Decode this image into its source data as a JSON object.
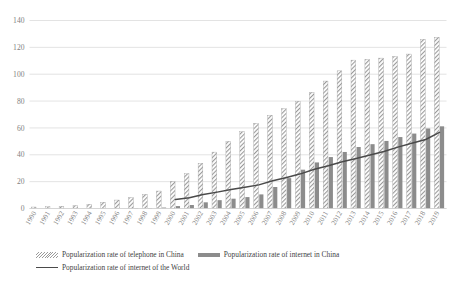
{
  "chart_data": {
    "type": "bar",
    "title": "",
    "subtitle": "",
    "xlabel": "",
    "ylabel": "",
    "ylim": [
      0,
      140
    ],
    "yticks": [
      0,
      20,
      40,
      60,
      80,
      100,
      120,
      140
    ],
    "ytick_labels": [
      "0",
      "20",
      "40",
      "60",
      "80",
      "100",
      "120",
      "140"
    ],
    "grid": true,
    "legend_position": "bottom",
    "categories": [
      "1990",
      "1991",
      "1992",
      "1993",
      "1994",
      "1995",
      "1996",
      "1997",
      "1998",
      "1999",
      "2000",
      "2001",
      "2002",
      "2003",
      "2004",
      "2005",
      "2006",
      "2007",
      "2008",
      "2009",
      "2010",
      "2011",
      "2012",
      "2013",
      "2014",
      "2015",
      "2016",
      "2017",
      "2018",
      "2019"
    ],
    "series": [
      {
        "name": "Popularization rate of telephone in China",
        "style": "bar-hatched",
        "color": "#9a9a9a",
        "values": [
          1.1,
          1.3,
          1.6,
          2.2,
          3.2,
          4.7,
          6.3,
          8.1,
          10.5,
          13.0,
          20.1,
          25.9,
          33.7,
          42.0,
          50.0,
          57.2,
          63.4,
          69.5,
          74.3,
          79.9,
          86.5,
          94.9,
          102.5,
          110.5,
          111.0,
          112.0,
          113.2,
          115.0,
          126.0,
          127.5
        ]
      },
      {
        "name": "Popularization rate of internet in China",
        "style": "bar-solid",
        "color": "#8c8c8c",
        "values": [
          0,
          0,
          0,
          0,
          0,
          0,
          0,
          0.1,
          0.2,
          0.7,
          1.8,
          2.6,
          4.6,
          6.2,
          7.3,
          8.5,
          10.5,
          16.0,
          22.6,
          28.9,
          34.3,
          38.3,
          42.1,
          45.8,
          47.9,
          50.3,
          53.2,
          55.8,
          59.6,
          61.2
        ]
      },
      {
        "name": "Popularization rate of internet of the World",
        "style": "line",
        "color": "#4a4a4a",
        "start_year": "2000",
        "values": [
          null,
          null,
          null,
          null,
          null,
          null,
          null,
          null,
          null,
          null,
          6.7,
          8.0,
          10.5,
          12.2,
          14.1,
          15.8,
          17.6,
          20.6,
          23.1,
          25.8,
          29.2,
          31.8,
          34.8,
          37.3,
          39.9,
          42.4,
          45.7,
          48.6,
          51.4,
          56.7
        ]
      }
    ],
    "legend": [
      {
        "label": "Popularization rate of telephone in China",
        "marker": "hatched-bar-swatch"
      },
      {
        "label": "Popularization rate of internet in China",
        "marker": "solid-bar-swatch"
      },
      {
        "label": "Popularization rate of internet of the World",
        "marker": "line-swatch"
      }
    ],
    "colors": {
      "hatched_bar": "#9a9a9a",
      "solid_bar": "#8c8c8c",
      "line": "#4a4a4a",
      "gridline": "#dcdcdc",
      "axis_text": "#7f7f7f",
      "background": "#ffffff"
    }
  }
}
